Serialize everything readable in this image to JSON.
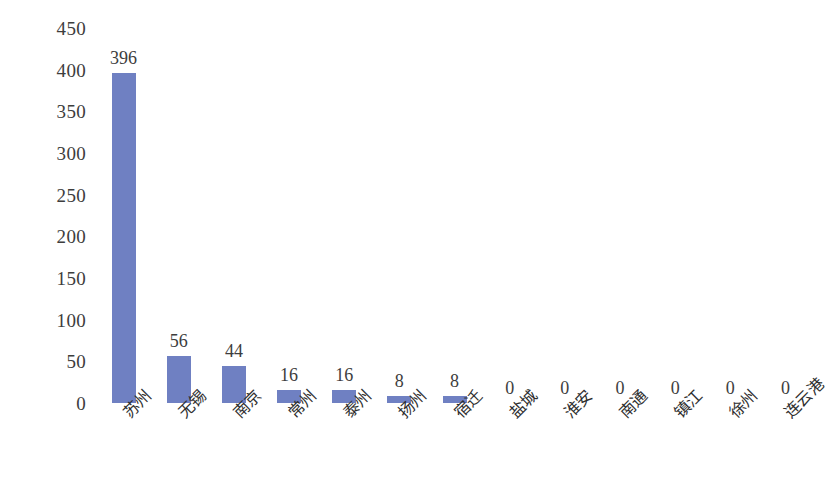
{
  "chart_data": {
    "type": "bar",
    "title": "",
    "subtitle": "",
    "xlabel": "",
    "ylabel": "",
    "ylim": [
      0,
      450
    ],
    "ytick_step": 50,
    "yticks": [
      "450",
      "400",
      "350",
      "300",
      "250",
      "200",
      "150",
      "100",
      "50",
      "0"
    ],
    "grid": false,
    "legend": false,
    "legend_position": "none",
    "bar_color": "#6F80C2",
    "categories": [
      "苏州",
      "无锡",
      "南京",
      "常州",
      "泰州",
      "扬州",
      "宿迁",
      "盐城",
      "淮安",
      "南通",
      "镇江",
      "徐州",
      "连云港"
    ],
    "values": [
      396,
      56,
      44,
      16,
      16,
      8,
      8,
      0,
      0,
      0,
      0,
      0,
      0
    ],
    "data_labels": [
      "396",
      "56",
      "44",
      "16",
      "16",
      "8",
      "8",
      "0",
      "0",
      "0",
      "0",
      "0",
      "0"
    ],
    "series": [
      {
        "name": "",
        "values": [
          396,
          56,
          44,
          16,
          16,
          8,
          8,
          0,
          0,
          0,
          0,
          0,
          0
        ]
      }
    ]
  }
}
